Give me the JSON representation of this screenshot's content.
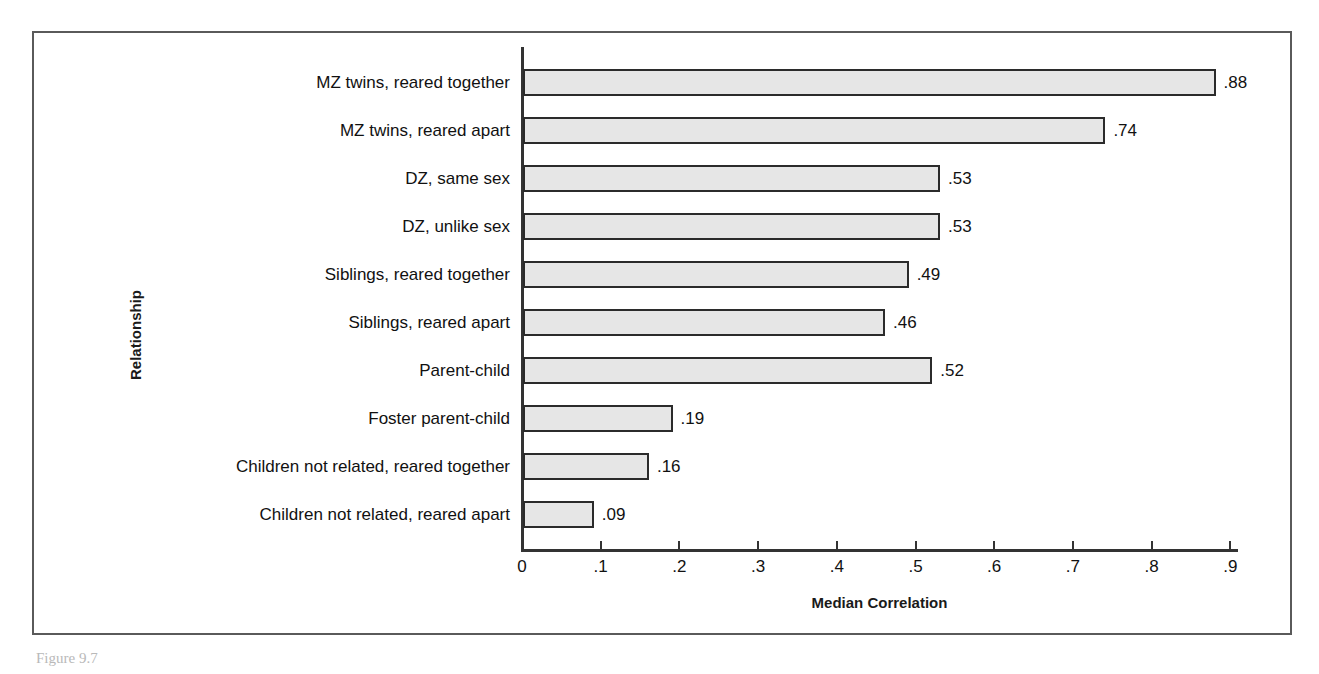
{
  "figure": {
    "caption": "Figure 9.7"
  },
  "chart_data": {
    "type": "bar",
    "orientation": "horizontal",
    "title": "",
    "xlabel": "Median Correlation",
    "ylabel": "Relationship",
    "xlim": [
      0,
      1.0
    ],
    "xticks": [
      "0",
      ".1",
      ".2",
      ".3",
      ".4",
      ".5",
      ".6",
      ".7",
      ".8",
      ".9"
    ],
    "xtick_values": [
      0,
      0.1,
      0.2,
      0.3,
      0.4,
      0.5,
      0.6,
      0.7,
      0.8,
      0.9
    ],
    "grid": false,
    "legend": null,
    "bar_fill_color": "#e6e6e6",
    "bar_border_color": "#2b2b2b",
    "categories": [
      "MZ twins, reared together",
      "MZ twins, reared apart",
      "DZ, same sex",
      "DZ, unlike sex",
      "Siblings, reared together",
      "Siblings, reared apart",
      "Parent-child",
      "Foster parent-child",
      "Children not related, reared together",
      "Children not related, reared apart"
    ],
    "values": [
      0.88,
      0.74,
      0.53,
      0.53,
      0.49,
      0.46,
      0.52,
      0.19,
      0.16,
      0.09
    ],
    "value_labels": [
      ".88",
      ".74",
      ".53",
      ".53",
      ".49",
      ".46",
      ".52",
      ".19",
      ".16",
      ".09"
    ]
  }
}
